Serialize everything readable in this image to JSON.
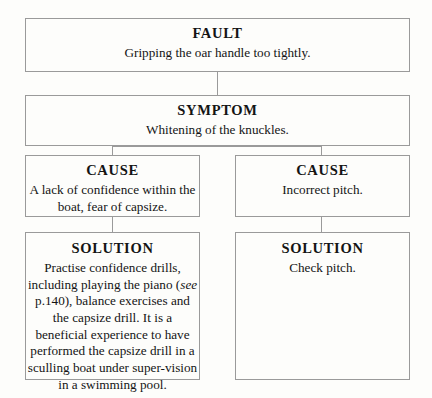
{
  "diagram": {
    "colors": {
      "border": "#9a9a9a",
      "background": "#fdfdfb",
      "text": "#141414"
    },
    "nodes": {
      "fault": {
        "heading": "FAULT",
        "text": "Gripping the oar handle too tightly."
      },
      "symptom": {
        "heading": "SYMPTOM",
        "text": "Whitening of the knuckles."
      },
      "cause_left": {
        "heading": "CAUSE",
        "text": "A lack of confidence within the boat, fear of capsize."
      },
      "cause_right": {
        "heading": "CAUSE",
        "text": "Incorrect pitch."
      },
      "solution_left": {
        "heading": "SOLUTION",
        "text_before_italic": "Practise confidence drills, including playing the piano (",
        "italic": "see",
        "text_after_italic": " p.140), balance exercises and the capsize drill.  It is a beneficial experience to have performed the capsize drill in a sculling boat under super-vision in a swimming pool."
      },
      "solution_right": {
        "heading": "SOLUTION",
        "text": "Check pitch."
      }
    }
  }
}
